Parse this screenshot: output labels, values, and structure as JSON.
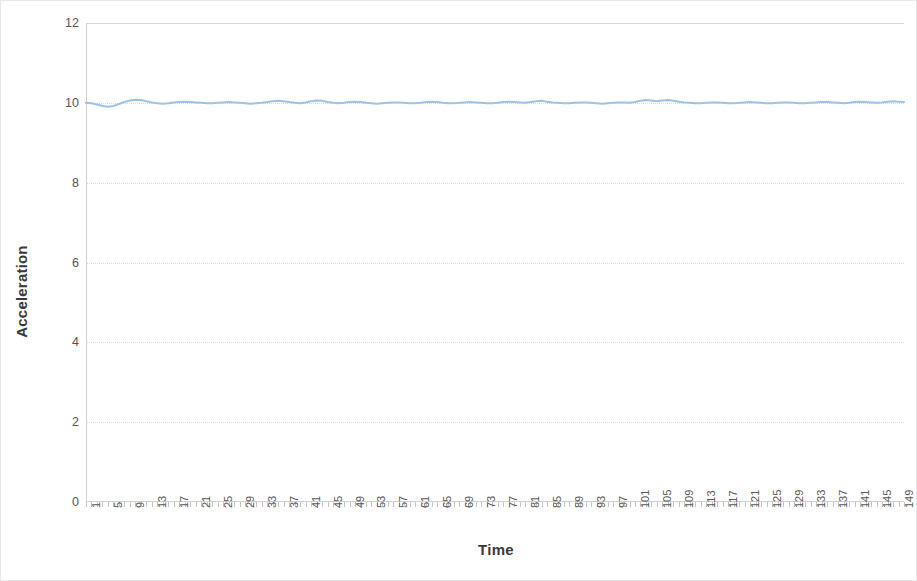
{
  "chart_data": {
    "type": "line",
    "title": "",
    "xlabel": "Time",
    "ylabel": "Acceleration",
    "ylim": [
      0,
      12
    ],
    "xlim": [
      1,
      150
    ],
    "y_ticks": [
      0,
      2,
      4,
      6,
      8,
      10,
      12
    ],
    "x_ticks": [
      1,
      5,
      9,
      13,
      17,
      21,
      25,
      29,
      33,
      37,
      41,
      45,
      49,
      53,
      57,
      61,
      65,
      69,
      73,
      77,
      81,
      85,
      89,
      93,
      97,
      101,
      105,
      109,
      113,
      117,
      121,
      125,
      129,
      133,
      137,
      141,
      145,
      149
    ],
    "grid": true,
    "legend": "none",
    "series_color": "#9DC3E6",
    "series": [
      {
        "name": "Acceleration",
        "x": [
          1,
          2,
          3,
          4,
          5,
          6,
          7,
          8,
          9,
          10,
          11,
          12,
          13,
          14,
          15,
          16,
          17,
          18,
          19,
          20,
          21,
          22,
          23,
          24,
          25,
          26,
          27,
          28,
          29,
          30,
          31,
          32,
          33,
          34,
          35,
          36,
          37,
          38,
          39,
          40,
          41,
          42,
          43,
          44,
          45,
          46,
          47,
          48,
          49,
          50,
          51,
          52,
          53,
          54,
          55,
          56,
          57,
          58,
          59,
          60,
          61,
          62,
          63,
          64,
          65,
          66,
          67,
          68,
          69,
          70,
          71,
          72,
          73,
          74,
          75,
          76,
          77,
          78,
          79,
          80,
          81,
          82,
          83,
          84,
          85,
          86,
          87,
          88,
          89,
          90,
          91,
          92,
          93,
          94,
          95,
          96,
          97,
          98,
          99,
          100,
          101,
          102,
          103,
          104,
          105,
          106,
          107,
          108,
          109,
          110,
          111,
          112,
          113,
          114,
          115,
          116,
          117,
          118,
          119,
          120,
          121,
          122,
          123,
          124,
          125,
          126,
          127,
          128,
          129,
          130,
          131,
          132,
          133,
          134,
          135,
          136,
          137,
          138,
          139,
          140,
          141,
          142,
          143,
          144,
          145,
          146,
          147,
          148,
          149,
          150
        ],
        "values": [
          10.0,
          9.99,
          9.96,
          9.92,
          9.9,
          9.92,
          9.97,
          10.02,
          10.06,
          10.08,
          10.07,
          10.04,
          10.01,
          9.99,
          9.98,
          9.99,
          10.01,
          10.02,
          10.03,
          10.02,
          10.01,
          10.0,
          9.99,
          9.99,
          10.0,
          10.01,
          10.02,
          10.01,
          10.0,
          9.99,
          9.98,
          9.99,
          10.0,
          10.02,
          10.04,
          10.05,
          10.04,
          10.02,
          10.0,
          9.99,
          10.01,
          10.04,
          10.06,
          10.05,
          10.02,
          10.0,
          9.99,
          10.0,
          10.02,
          10.03,
          10.02,
          10.0,
          9.99,
          9.98,
          9.99,
          10.0,
          10.01,
          10.01,
          10.0,
          9.99,
          9.99,
          10.0,
          10.02,
          10.03,
          10.02,
          10.0,
          9.99,
          9.99,
          10.0,
          10.01,
          10.02,
          10.01,
          10.0,
          9.99,
          9.99,
          10.0,
          10.02,
          10.03,
          10.02,
          10.01,
          10.0,
          10.02,
          10.04,
          10.05,
          10.03,
          10.01,
          10.0,
          9.99,
          9.99,
          10.0,
          10.01,
          10.01,
          10.0,
          9.99,
          9.98,
          9.99,
          10.0,
          10.01,
          10.01,
          10.0,
          10.02,
          10.05,
          10.07,
          10.06,
          10.04,
          10.06,
          10.07,
          10.05,
          10.03,
          10.01,
          10.0,
          9.99,
          9.99,
          10.0,
          10.01,
          10.01,
          10.0,
          9.99,
          9.99,
          10.0,
          10.01,
          10.02,
          10.01,
          10.0,
          9.99,
          9.99,
          10.0,
          10.01,
          10.01,
          10.0,
          9.99,
          9.99,
          10.0,
          10.01,
          10.02,
          10.02,
          10.01,
          10.0,
          9.99,
          10.0,
          10.02,
          10.03,
          10.02,
          10.01,
          10.0,
          10.01,
          10.03,
          10.04,
          10.03,
          10.02
        ]
      }
    ]
  }
}
